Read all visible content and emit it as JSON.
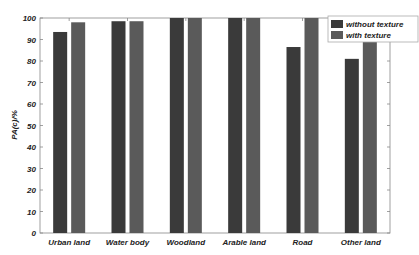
{
  "chart_data": {
    "type": "bar",
    "title": "",
    "xlabel": "",
    "ylabel": "PA(c)/%",
    "ylim": [
      0,
      100
    ],
    "yticks": [
      0,
      10,
      20,
      30,
      40,
      50,
      60,
      70,
      80,
      90,
      100
    ],
    "grid": false,
    "legend_position": "upper right",
    "categories": [
      "Urban land",
      "Water body",
      "Woodland",
      "Arable land",
      "Road",
      "Other land"
    ],
    "series": [
      {
        "name": "without texture",
        "color": "#3a3a3a",
        "values": [
          93.5,
          98.5,
          100,
          100,
          86.5,
          81
        ]
      },
      {
        "name": "with texture",
        "color": "#5a5a5a",
        "values": [
          98,
          98.5,
          100,
          100,
          100,
          90
        ]
      }
    ]
  }
}
